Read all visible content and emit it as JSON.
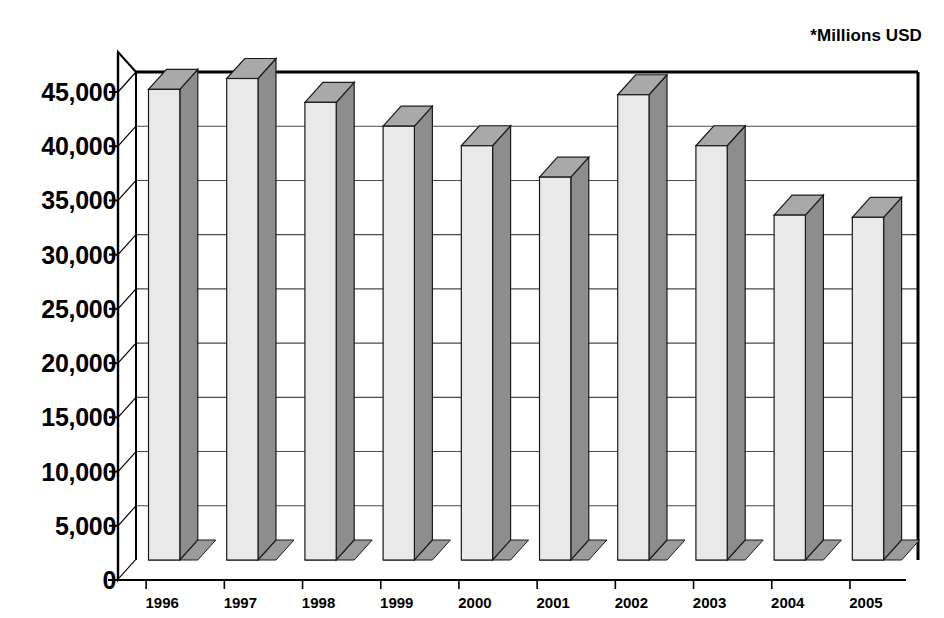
{
  "chart_data": {
    "type": "bar",
    "title": "",
    "subtitle": "",
    "unit_note": "*Millions USD",
    "xlabel": "",
    "ylabel": "",
    "categories": [
      "1996",
      "1997",
      "1998",
      "1999",
      "2000",
      "2001",
      "2002",
      "2003",
      "2004",
      "2005"
    ],
    "values": [
      43400,
      44400,
      42200,
      40000,
      38200,
      35300,
      42900,
      38200,
      31800,
      31600
    ],
    "series": [
      {
        "name": "",
        "values": [
          43400,
          44400,
          42200,
          40000,
          38200,
          35300,
          42900,
          38200,
          31800,
          31600
        ]
      }
    ],
    "ylim": [
      0,
      45000
    ],
    "ytick_values": [
      0,
      5000,
      10000,
      15000,
      20000,
      25000,
      30000,
      35000,
      40000,
      45000
    ],
    "ytick_labels": [
      "0",
      "5,000",
      "10,000",
      "15,000",
      "20,000",
      "25,000",
      "30,000",
      "35,000",
      "40,000",
      "45,000"
    ],
    "grid": true,
    "grid_axis": "y",
    "legend": false,
    "legend_position": "none",
    "style": "3d-column",
    "colors": {
      "bar_front": "#e9e9e9",
      "bar_side": "#8d8d8d",
      "bar_top": "#a9a9a9",
      "bar_outline": "#1a1a1a",
      "floor_front": "#3a3a3a",
      "floor_side": "#9b9b9b",
      "gridline": "#4a4a4a",
      "axis": "#000000",
      "background": "#ffffff",
      "text": "#000000"
    }
  }
}
